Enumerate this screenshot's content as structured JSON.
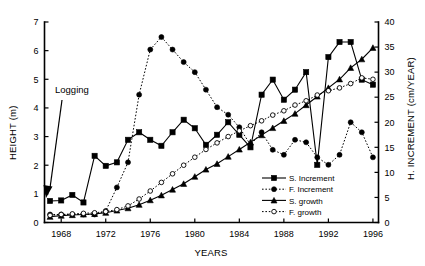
{
  "chart_data": {
    "type": "line",
    "title": "",
    "xlabel": "YEARS",
    "ylabel": "HEIGHT (m)",
    "y2label": "H. INCREMENT (cm/YEAR)",
    "xlim": [
      1966.5,
      1996.5
    ],
    "ylim": [
      0,
      7
    ],
    "y2lim": [
      0,
      40
    ],
    "grid": false,
    "legend_position": "inside-lower-right",
    "x_ticks": [
      1968,
      1972,
      1976,
      1980,
      1984,
      1988,
      1992,
      1996
    ],
    "x_tick_labels": [
      "1968",
      "1972",
      "1976",
      "1980",
      "1984",
      "1988",
      "1992",
      "1996"
    ],
    "y_ticks": [
      0,
      1,
      2,
      3,
      4,
      5,
      6,
      7
    ],
    "y_tick_labels": [
      "0",
      "1",
      "2",
      "3",
      "4",
      "5",
      "6",
      "7"
    ],
    "y2_ticks": [
      0,
      5,
      10,
      15,
      20,
      25,
      30,
      35,
      40
    ],
    "y2_tick_labels": [
      "0",
      "5",
      "10",
      "15",
      "20",
      "25",
      "30",
      "35",
      "40"
    ],
    "annotations": [
      {
        "text": "Logging",
        "x": 1969.0,
        "y": 0.25,
        "label_x": 1968.3,
        "label_y": 4.15
      }
    ],
    "x": [
      1967,
      1968,
      1969,
      1970,
      1971,
      1972,
      1973,
      1974,
      1975,
      1976,
      1977,
      1978,
      1979,
      1980,
      1981,
      1982,
      1983,
      1984,
      1985,
      1986,
      1987,
      1988,
      1989,
      1990,
      1991,
      1992,
      1993,
      1994,
      1995,
      1996
    ],
    "series": [
      {
        "name": "S. Increment",
        "axis": "right",
        "marker": "filled-square",
        "linestyle": "solid",
        "values": [
          4.3,
          4.4,
          5.5,
          4.0,
          13.3,
          11.3,
          12.0,
          16.5,
          18.0,
          16.5,
          15.3,
          18.0,
          20.5,
          18.8,
          15.5,
          17.5,
          20.0,
          17.5,
          15.0,
          25.5,
          28.5,
          24.5,
          26.5,
          30.0,
          11.5,
          33.0,
          36.0,
          36.0,
          28.5,
          27.5
        ]
      },
      {
        "name": "F. Increment",
        "axis": "right",
        "marker": "filled-circle",
        "linestyle": "dotted",
        "values": [
          1.6,
          1.6,
          1.6,
          1.6,
          1.6,
          2.3,
          7.0,
          12.0,
          25.5,
          34.5,
          37.0,
          34.5,
          32.0,
          30.0,
          26.5,
          23.0,
          21.5,
          19.0,
          15.5,
          18.0,
          14.5,
          13.5,
          16.5,
          16.0,
          13.0,
          11.5,
          13.5,
          20.0,
          18.0,
          13.0
        ]
      },
      {
        "name": "S. growth",
        "axis": "left",
        "marker": "filled-triangle",
        "linestyle": "solid",
        "values": [
          0.2,
          0.24,
          0.26,
          0.28,
          0.3,
          0.34,
          0.42,
          0.5,
          0.62,
          0.78,
          0.95,
          1.15,
          1.35,
          1.6,
          1.85,
          2.05,
          2.3,
          2.55,
          2.8,
          3.05,
          3.3,
          3.55,
          3.8,
          4.1,
          4.4,
          4.7,
          5.0,
          5.4,
          5.7,
          6.1
        ]
      },
      {
        "name": "F. growth",
        "axis": "left",
        "marker": "open-circle",
        "linestyle": "dotted",
        "values": [
          0.25,
          0.28,
          0.3,
          0.32,
          0.34,
          0.38,
          0.45,
          0.58,
          0.82,
          1.1,
          1.4,
          1.7,
          2.0,
          2.28,
          2.55,
          2.78,
          3.0,
          3.2,
          3.38,
          3.55,
          3.75,
          3.9,
          4.1,
          4.25,
          4.45,
          4.6,
          4.7,
          4.85,
          5.05,
          5.0
        ]
      }
    ]
  },
  "legend": {
    "entries": [
      {
        "label": "S. Increment"
      },
      {
        "label": "F. Increment"
      },
      {
        "label": "S. growth"
      },
      {
        "label": "F. growth"
      }
    ]
  }
}
